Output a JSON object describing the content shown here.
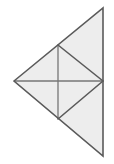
{
  "figure": {
    "name": "subdivided-triangle-figure",
    "canvas": {
      "width": 114,
      "height": 164
    },
    "colors": {
      "background": "#ffffff",
      "fill": "#ededed",
      "outer_stroke": "#5a5a5a",
      "inner_stroke": "#767676"
    },
    "vertices": {
      "left": [
        14,
        81
      ],
      "top_apex": [
        103,
        8
      ],
      "bottom_apex": [
        103,
        156
      ],
      "upper_mid": [
        58,
        45
      ],
      "lower_mid": [
        58,
        119
      ],
      "right_mid": [
        103,
        81
      ]
    },
    "outer_outline": [
      [
        14,
        81
      ],
      [
        103,
        8
      ],
      [
        103,
        156
      ]
    ],
    "regions": [
      {
        "name": "upper-outer-region",
        "points": [
          [
            14,
            81
          ],
          [
            103,
            8
          ],
          [
            103,
            81
          ]
        ]
      },
      {
        "name": "lower-outer-region",
        "points": [
          [
            14,
            81
          ],
          [
            103,
            81
          ],
          [
            103,
            156
          ]
        ]
      }
    ],
    "segments": [
      {
        "name": "vertical-internal-segment",
        "from": [
          58,
          45
        ],
        "to": [
          58,
          119
        ]
      },
      {
        "name": "horizontal-internal-segment",
        "from": [
          14,
          81
        ],
        "to": [
          103,
          81
        ]
      },
      {
        "name": "upper-inner-diagonal",
        "from": [
          58,
          45
        ],
        "to": [
          103,
          81
        ]
      },
      {
        "name": "lower-inner-diagonal",
        "from": [
          58,
          119
        ],
        "to": [
          103,
          81
        ]
      }
    ]
  }
}
